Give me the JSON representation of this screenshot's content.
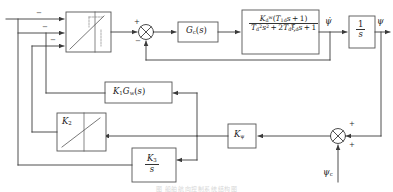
{
  "diagram": {
    "type": "control-block-diagram",
    "caption": "图 船舶航向控制系统结构图",
    "line_color": "#3a3a3a",
    "block_stroke": "#555555",
    "block_fill": "#ffffff"
  },
  "blocks": {
    "saturation_main": {
      "name": "rate-limiter",
      "label": ""
    },
    "controller": {
      "label_html": "G<sub>c</sub>(s)",
      "plain": "Gc(s)"
    },
    "plant": {
      "numerator_html": "K<sub>d</sub><sup>w</sup>(T<sub>1d</sub>s + 1)",
      "denominator_html": "T<sub>d</sub><sup>2</sup>s<sup>2</sup> + 2T<sub>d</sub>&#958;<sub>d</sub>s + 1",
      "numerator_plain": "Kd^w(T1d s + 1)",
      "denominator_plain": "Td^2 s^2 + 2 Td xi_d s + 1"
    },
    "integrator": {
      "numerator_html": "1",
      "denominator_html": "s",
      "plain": "1/s"
    },
    "washout": {
      "label_html": "K<sub>1</sub>G<sub>w</sub>(s)",
      "plain": "K1Gw(s)"
    },
    "gain_k2": {
      "label_html": "K<sub>2</sub>",
      "plain": "K2"
    },
    "gain_kpsi": {
      "label_html": "K<sub>&#968;</sub>",
      "plain": "K_psi"
    },
    "integral_k3": {
      "numerator_html": "K<sub>3</sub>",
      "denominator_html": "s",
      "plain": "K3/s"
    }
  },
  "signals": {
    "psi_dot": "&#968;&#775;",
    "psi_dot_plain": "psi-dot",
    "psi_out": "&#968;",
    "psi_out_plain": "psi",
    "psi_command": "&#968;<sub>c</sub>",
    "psi_command_plain": "psi_c"
  },
  "summing_junctions": {
    "forward": {
      "name": "forward-sum",
      "signs": [
        "+",
        "-"
      ]
    },
    "command": {
      "name": "command-sum",
      "signs": [
        "+",
        "+"
      ]
    }
  },
  "input_signs": [
    "-",
    "-",
    "-"
  ]
}
